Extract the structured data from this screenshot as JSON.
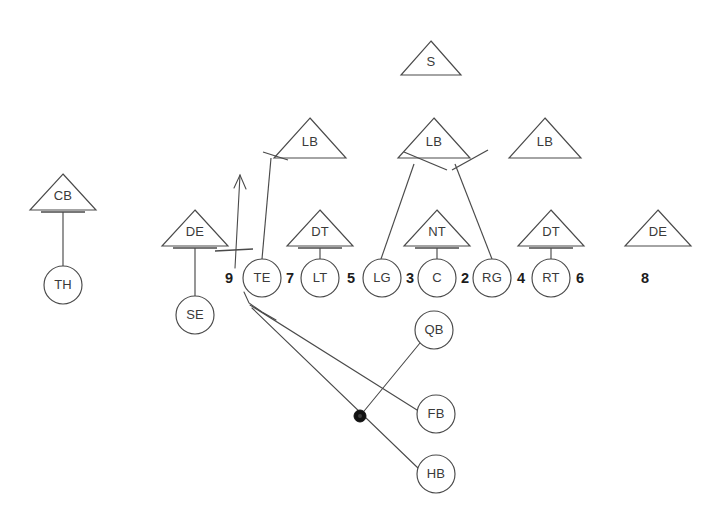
{
  "diagram": {
    "stroke_color": "#4a4a4a",
    "label_color": "#3a3a3a",
    "gap_number_color": "#1c1c1c",
    "ball_marker_color": "#111111"
  },
  "offense": {
    "line": [
      {
        "label": "TE",
        "cx": 262,
        "cy": 278,
        "r": 19
      },
      {
        "label": "LT",
        "cx": 320,
        "cy": 278,
        "r": 19
      },
      {
        "label": "LG",
        "cx": 382,
        "cy": 278,
        "r": 19
      },
      {
        "label": "C",
        "cx": 437,
        "cy": 278,
        "r": 19
      },
      {
        "label": "RG",
        "cx": 492,
        "cy": 278,
        "r": 19
      },
      {
        "label": "RT",
        "cx": 551,
        "cy": 278,
        "r": 19
      }
    ],
    "receivers": [
      {
        "label": "SE",
        "cx": 195,
        "cy": 315,
        "r": 19
      },
      {
        "label": "TH",
        "cx": 63,
        "cy": 285,
        "r": 19
      }
    ],
    "backfield": [
      {
        "label": "QB",
        "cx": 434,
        "cy": 330,
        "r": 19
      },
      {
        "label": "FB",
        "cx": 436,
        "cy": 414,
        "r": 19
      },
      {
        "label": "HB",
        "cx": 436,
        "cy": 474,
        "r": 19
      }
    ]
  },
  "gaps": [
    {
      "number": "9",
      "x": 229,
      "y": 279
    },
    {
      "number": "7",
      "x": 290,
      "y": 279
    },
    {
      "number": "5",
      "x": 351,
      "y": 279
    },
    {
      "number": "3",
      "x": 410,
      "y": 279
    },
    {
      "number": "2",
      "x": 465,
      "y": 279
    },
    {
      "number": "4",
      "x": 521,
      "y": 279
    },
    {
      "number": "6",
      "x": 580,
      "y": 279
    },
    {
      "number": "8",
      "x": 645,
      "y": 279
    }
  ],
  "defense": {
    "line": [
      {
        "label": "DE",
        "cx": 195,
        "cy": 228,
        "half_width": 33,
        "height": 36,
        "has_crossbar": true
      },
      {
        "label": "DT",
        "cx": 320,
        "cy": 228,
        "half_width": 33,
        "height": 36,
        "has_crossbar": true
      },
      {
        "label": "NT",
        "cx": 437,
        "cy": 228,
        "half_width": 33,
        "height": 36,
        "has_crossbar": true
      },
      {
        "label": "DT",
        "cx": 551,
        "cy": 228,
        "half_width": 33,
        "height": 36,
        "has_crossbar": true
      },
      {
        "label": "DE",
        "cx": 658,
        "cy": 228,
        "half_width": 33,
        "height": 36,
        "has_crossbar": false
      }
    ],
    "linebackers": [
      {
        "label": "LB",
        "cx": 310,
        "cy": 138,
        "half_width": 36,
        "height": 40
      },
      {
        "label": "LB",
        "cx": 434,
        "cy": 138,
        "half_width": 36,
        "height": 40
      },
      {
        "label": "LB",
        "cx": 545,
        "cy": 138,
        "half_width": 36,
        "height": 40
      }
    ],
    "secondary": [
      {
        "label": "S",
        "cx": 431,
        "cy": 58,
        "half_width": 30,
        "height": 34
      },
      {
        "label": "CB",
        "cx": 63,
        "cy": 192,
        "half_width": 33,
        "height": 36,
        "has_crossbar": true
      }
    ]
  },
  "assignments": {
    "blitz_arrow": {
      "from_x": 235,
      "from_y": 268,
      "to_x": 240,
      "to_y": 175,
      "crossbar_y": 251
    },
    "stems": [
      {
        "name": "cb-to-th",
        "x1": 63,
        "y1": 212,
        "x2": 63,
        "y2": 266,
        "bar_y": 212,
        "bar_half": 22
      },
      {
        "name": "de-to-se",
        "x1": 195,
        "y1": 248,
        "x2": 195,
        "y2": 296,
        "bar_y": 248,
        "bar_half": 22
      },
      {
        "name": "dt-to-lt",
        "x1": 320,
        "y1": 248,
        "x2": 320,
        "y2": 259,
        "bar_y": 248,
        "bar_half": 22
      },
      {
        "name": "nt-to-c",
        "x1": 437,
        "y1": 248,
        "x2": 437,
        "y2": 259,
        "bar_y": 248,
        "bar_half": 22
      },
      {
        "name": "dt-to-rt",
        "x1": 551,
        "y1": 248,
        "x2": 551,
        "y2": 259,
        "bar_y": 248,
        "bar_half": 22
      }
    ],
    "lb_stems": [
      {
        "name": "lb-left-to-te",
        "x1": 271,
        "y1": 158,
        "x2": 262,
        "y2": 259,
        "bar_x1": 263,
        "bar_y1": 152,
        "bar_x2": 288,
        "bar_y2": 160
      },
      {
        "name": "lb-mid-to-lg",
        "x1": 414,
        "y1": 164,
        "x2": 381,
        "y2": 259,
        "bar_x1": 404,
        "bar_y1": 152,
        "bar_x2": 447,
        "bar_y2": 170
      },
      {
        "name": "lb-mid-to-rg",
        "x1": 455,
        "y1": 164,
        "x2": 492,
        "y2": 259,
        "bar_x1": 452,
        "bar_y1": 170,
        "bar_x2": 488,
        "bar_y2": 150
      }
    ],
    "routes": [
      {
        "name": "route-to-fb",
        "x1": 250,
        "y1": 305,
        "x2": 417,
        "y2": 410
      },
      {
        "name": "route-to-hb",
        "x1": 252,
        "y1": 308,
        "x2": 419,
        "y2": 469
      },
      {
        "name": "route-qb-to-ball",
        "x1": 420,
        "y1": 343,
        "x2": 360,
        "y2": 416
      }
    ],
    "ball_marker": {
      "cx": 360,
      "cy": 416,
      "r": 6
    }
  }
}
